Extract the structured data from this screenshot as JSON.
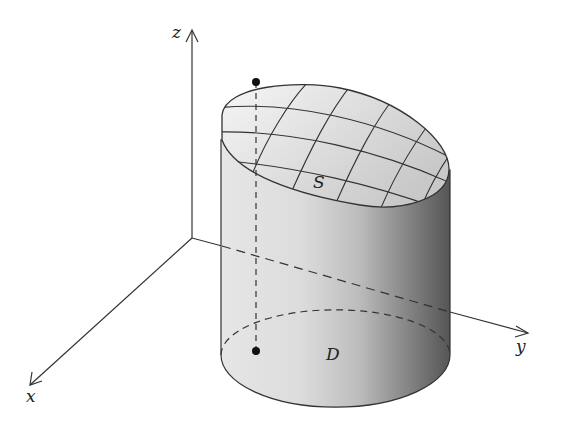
{
  "diagram": {
    "axes": {
      "x_label": "x",
      "y_label": "y",
      "z_label": "z"
    },
    "surface_label": "S",
    "region_label": "D",
    "colors": {
      "line": "#333333",
      "shade_light": "#f2f2f2",
      "shade_dark": "#5a5a5a"
    }
  }
}
